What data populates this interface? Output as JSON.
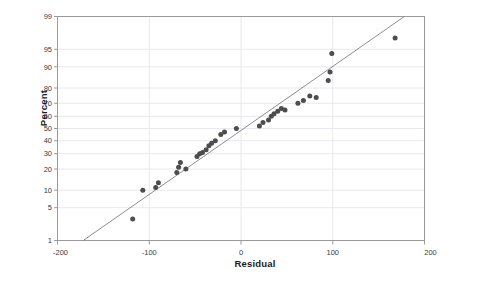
{
  "chart_data": {
    "type": "scatter",
    "title": "",
    "xlabel": "Residual",
    "ylabel": "Percent",
    "xlim": [
      -200,
      200
    ],
    "ylim": [
      1,
      99
    ],
    "yscale": "normal-probability",
    "grid": true,
    "legend": null,
    "xticks": [
      -200,
      -100,
      0,
      100,
      200
    ],
    "xtick_labels": [
      "-200",
      "-100",
      "0",
      "100",
      "200"
    ],
    "yticks": [
      1,
      5,
      10,
      20,
      30,
      40,
      50,
      60,
      70,
      80,
      90,
      95,
      99
    ],
    "ytick_labels": [
      "1",
      "5",
      "10",
      "20",
      "30",
      "40",
      "50",
      "60",
      "70",
      "80",
      "90",
      "95",
      "99"
    ],
    "point_color": "#4d4d4d",
    "line_color": "#808080",
    "grid_color": "#e8e8ee",
    "frame_color": "#9a9a9a",
    "series": [
      {
        "name": "residuals",
        "x": [
          -118,
          -107,
          -93,
          -90,
          -70,
          -68,
          -66,
          -60,
          -48,
          -45,
          -42,
          -38,
          -35,
          -32,
          -28,
          -22,
          -18,
          -5,
          20,
          24,
          30,
          33,
          36,
          40,
          44,
          48,
          62,
          68,
          75,
          82,
          95,
          97,
          99,
          168
        ],
        "y": [
          3,
          10,
          11,
          13,
          18,
          21,
          24,
          20,
          28,
          30,
          31,
          33,
          36,
          38,
          40,
          45,
          47,
          50,
          52,
          55,
          57,
          60,
          62,
          64,
          66,
          65,
          70,
          72,
          75,
          74,
          84,
          88,
          94,
          97
        ]
      }
    ],
    "reference_line": {
      "name": "normal-fit-line",
      "x_start": -172,
      "y_start": 1,
      "x_end": 178,
      "y_end": 99
    }
  }
}
